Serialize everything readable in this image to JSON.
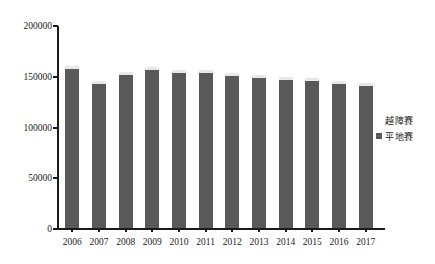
{
  "chart_data": {
    "type": "bar",
    "title": "",
    "xlabel": "",
    "ylabel": "",
    "categories": [
      "2006",
      "2007",
      "2008",
      "2009",
      "2010",
      "2011",
      "2012",
      "2013",
      "2014",
      "2015",
      "2016",
      "2017"
    ],
    "series": [
      {
        "name": "平地賽",
        "color": "#595959",
        "values": [
          158000,
          143000,
          152000,
          157000,
          154000,
          154000,
          151000,
          149000,
          147000,
          146000,
          143000,
          141000
        ]
      },
      {
        "name": "越障賽",
        "color": "#e8e8e8",
        "values": [
          3000,
          3000,
          3000,
          3000,
          3000,
          3000,
          3000,
          3000,
          3000,
          3000,
          3000,
          3000
        ]
      }
    ],
    "totals": [
      161000,
      146000,
      155000,
      160000,
      157000,
      157000,
      154000,
      152000,
      150000,
      149000,
      146000,
      144000
    ],
    "ylim": [
      0,
      200000
    ],
    "ytick_values": [
      0,
      50000,
      100000,
      150000,
      200000
    ],
    "ytick_labels": [
      "0",
      "50000",
      "100000",
      "150000",
      "200000"
    ],
    "grid": false,
    "legend_position": "right"
  },
  "legend": {
    "entries": [
      {
        "label": "越障賽",
        "has_marker": false
      },
      {
        "label": "平地賽",
        "has_marker": true
      }
    ]
  },
  "colors": {
    "bar_primary": "#595959",
    "bar_secondary": "#e8e8e8",
    "axis": "#1a1a1a",
    "background": "#ffffff"
  }
}
